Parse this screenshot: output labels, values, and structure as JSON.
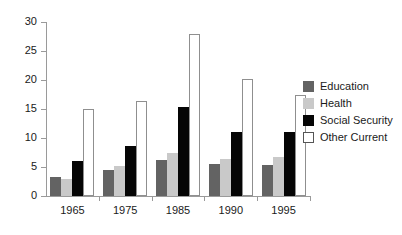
{
  "chart_data": {
    "type": "bar",
    "title": "",
    "subtitle": "",
    "xlabel": "",
    "ylabel": "",
    "categories": [
      "1965",
      "1975",
      "1985",
      "1990",
      "1995"
    ],
    "series": [
      {
        "name": "Education",
        "color": "#636363",
        "values": [
          3.3,
          4.4,
          6.2,
          5.5,
          5.3
        ]
      },
      {
        "name": "Health",
        "color": "#c9c9c9",
        "values": [
          3.0,
          5.1,
          7.5,
          6.3,
          6.7
        ]
      },
      {
        "name": "Social Security",
        "color": "#050505",
        "values": [
          6.0,
          8.7,
          15.3,
          11.1,
          11.0
        ]
      },
      {
        "name": "Other Current",
        "color": "#ffffff",
        "values": [
          15.0,
          16.4,
          27.9,
          20.2,
          17.5
        ]
      }
    ],
    "ylim": [
      0,
      30
    ],
    "ytick_step": 5,
    "yticks": [
      "30",
      "25",
      "20",
      "15",
      "10",
      "5",
      "0"
    ],
    "grid": false,
    "legend_position": "right",
    "annotations": []
  }
}
